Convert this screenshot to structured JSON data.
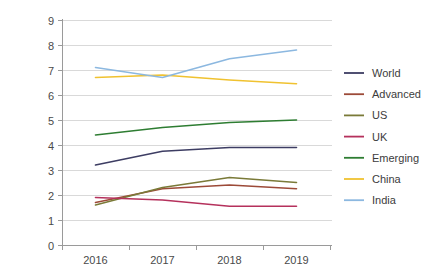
{
  "chart_data": {
    "type": "line",
    "title": "",
    "subtitle": "",
    "xlabel": "",
    "ylabel": "",
    "categories": [
      "2016",
      "2017",
      "2018",
      "2019"
    ],
    "x": [
      2016,
      2017,
      2018,
      2019
    ],
    "ylim": [
      0,
      9
    ],
    "yticks": [
      0,
      1,
      2,
      3,
      4,
      5,
      6,
      7,
      8,
      9
    ],
    "ytick_labels": [
      "0",
      "1",
      "2",
      "3",
      "4",
      "5",
      "6",
      "7",
      "8",
      "9"
    ],
    "xtick_labels": [
      "2016",
      "2017",
      "2018",
      "2019"
    ],
    "grid": "horizontal",
    "legend_position": "right",
    "markers": false,
    "series": [
      {
        "name": "World",
        "color": "#3d3d63",
        "values": [
          3.2,
          3.75,
          3.9,
          3.9
        ]
      },
      {
        "name": "Advanced",
        "color": "#9c4a38",
        "values": [
          1.7,
          2.25,
          2.4,
          2.25
        ]
      },
      {
        "name": "US",
        "color": "#7a7a38",
        "values": [
          1.6,
          2.3,
          2.7,
          2.5
        ]
      },
      {
        "name": "UK",
        "color": "#b5315c",
        "values": [
          1.9,
          1.8,
          1.55,
          1.55
        ]
      },
      {
        "name": "Emerging",
        "color": "#2e7d32",
        "values": [
          4.4,
          4.7,
          4.9,
          5.0
        ]
      },
      {
        "name": "China",
        "color": "#f0c230",
        "values": [
          6.7,
          6.8,
          6.6,
          6.45
        ]
      },
      {
        "name": "India",
        "color": "#8cb8e0",
        "values": [
          7.1,
          6.7,
          7.45,
          7.8
        ]
      }
    ]
  },
  "legend": {
    "items": [
      {
        "label": "World",
        "color": "#3d3d63"
      },
      {
        "label": "Advanced",
        "color": "#9c4a38"
      },
      {
        "label": "US",
        "color": "#7a7a38"
      },
      {
        "label": "UK",
        "color": "#b5315c"
      },
      {
        "label": "Emerging",
        "color": "#2e7d32"
      },
      {
        "label": "China",
        "color": "#f0c230"
      },
      {
        "label": "India",
        "color": "#8cb8e0"
      }
    ]
  },
  "axes": {
    "y_labels": [
      "9",
      "8",
      "7",
      "6",
      "5",
      "4",
      "3",
      "2",
      "1",
      "0"
    ],
    "x_labels": [
      "2016",
      "2017",
      "2018",
      "2019"
    ]
  }
}
